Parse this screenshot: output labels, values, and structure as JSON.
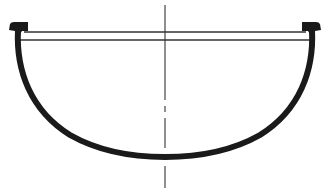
{
  "diagram": {
    "type": "technical-drawing",
    "colors": {
      "stroke": "#1a1a1a",
      "background": "#ffffff",
      "thin_line": "#333333"
    },
    "elements": {
      "left_flange": {
        "x": 8,
        "y": 22,
        "w": 21,
        "h": 9
      },
      "right_flange": {
        "x": 301,
        "y": 22,
        "w": 21,
        "h": 9
      },
      "rim_line_top": {
        "x1": 24,
        "x2": 306,
        "y": 32
      },
      "rim_line_bottom": {
        "x1": 18,
        "x2": 312,
        "y": 40
      },
      "center_axis": {
        "x": 165,
        "y1": 5,
        "y2": 188
      },
      "bowl_bottom_y": 157
    }
  }
}
